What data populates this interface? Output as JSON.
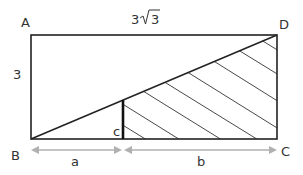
{
  "diagram": {
    "points": {
      "A": {
        "label": "A",
        "x": 31,
        "y": 35
      },
      "B": {
        "label": "B",
        "x": 31,
        "y": 139
      },
      "C": {
        "label": "C",
        "x": 277,
        "y": 139
      },
      "D": {
        "label": "D",
        "x": 277,
        "y": 35
      }
    },
    "labels": {
      "top_side": "3√3",
      "top_side_prefix": "3",
      "top_side_radicand": "3",
      "left_side": "3",
      "segment_c": "c",
      "segment_a": "a",
      "segment_b": "b"
    },
    "colors": {
      "stroke": "#222222",
      "arrow": "#b0b0b0",
      "text": "#333333",
      "hatch": "#333333"
    }
  }
}
